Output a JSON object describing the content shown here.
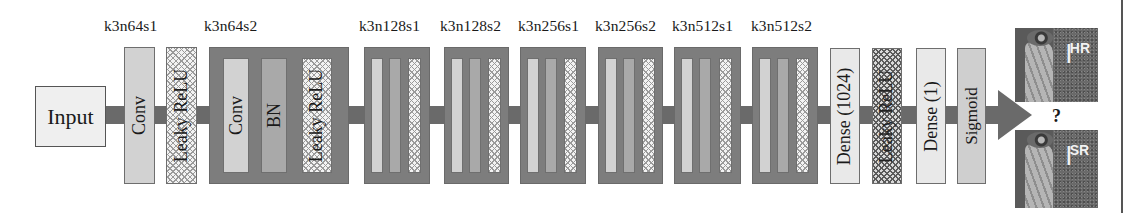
{
  "diagram": {
    "type": "discriminator-network-architecture",
    "input_label": "Input",
    "block_labels": [
      "k3n64s1",
      "k3n64s2",
      "k3n128s1",
      "k3n128s2",
      "k3n256s1",
      "k3n256s2",
      "k3n512s1",
      "k3n512s2"
    ],
    "first_layers": [
      "Conv",
      "Leaky ReLU"
    ],
    "block_layers": [
      "Conv",
      "BN",
      "Leaky ReLU"
    ],
    "head_layers": [
      "Dense (1024)",
      "Leaky ReLU",
      "Dense (1)",
      "Sigmoid"
    ],
    "output": {
      "question_mark": "?",
      "images": [
        {
          "letter": "I",
          "superscript": "HR"
        },
        {
          "letter": "I",
          "superscript": "SR"
        }
      ]
    },
    "colors": {
      "connector": "#6a6a6a",
      "block_bg": "#7d7d7d",
      "conv": "#d2d2d2",
      "bn": "#a9a9a9",
      "dense": "#e9e9e9",
      "sigmoid": "#cfcfcf",
      "input": "#efefef"
    }
  }
}
